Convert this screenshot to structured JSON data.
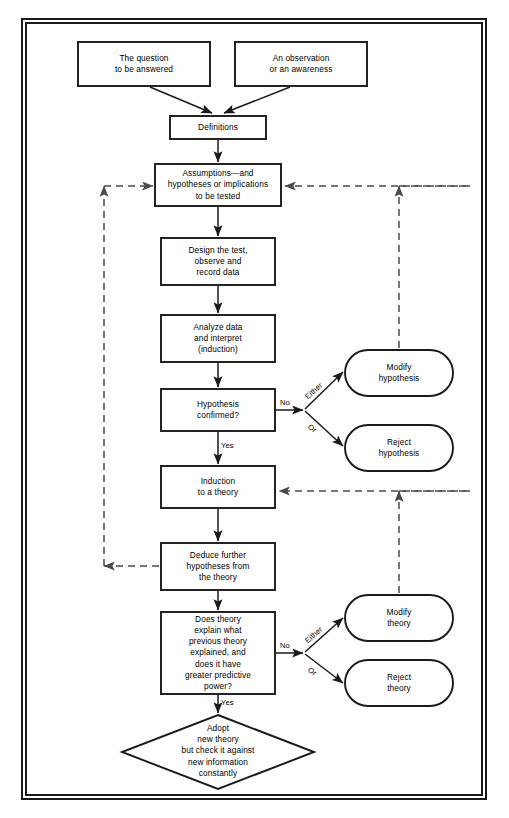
{
  "figure": {
    "type": "flowchart",
    "frame": "double-rule rectangular border"
  },
  "nodes": {
    "question": {
      "label": "The question\nto be answered",
      "shape": "rect"
    },
    "observation": {
      "label": "An observation\nor an awareness",
      "shape": "rect"
    },
    "definitions": {
      "label": "Definitions",
      "shape": "rect"
    },
    "assumptions": {
      "label": "Assumptions—and\nhypotheses or implications\nto be tested",
      "shape": "rect"
    },
    "design_test": {
      "label": "Design the test,\nobserve and\nrecord data",
      "shape": "rect"
    },
    "analyze": {
      "label": "Analyze data\nand interpret\n(induction)",
      "shape": "rect"
    },
    "hyp_confirmed": {
      "label": "Hypothesis\nconfirmed?",
      "shape": "rect"
    },
    "modify_hyp": {
      "label": "Modify\nhypothesis",
      "shape": "rounded"
    },
    "reject_hyp": {
      "label": "Reject\nhypothesis",
      "shape": "rounded"
    },
    "induction": {
      "label": "Induction\nto a theory",
      "shape": "rect"
    },
    "deduce": {
      "label": "Deduce further\nhypotheses from\nthe theory",
      "shape": "rect"
    },
    "does_theory": {
      "label": "Does theory\nexplain what\nprevious theory\nexplained, and\ndoes it have\ngreater predictive\npower?",
      "shape": "rect"
    },
    "modify_theory": {
      "label": "Modify\ntheory",
      "shape": "rounded"
    },
    "reject_theory": {
      "label": "Reject\ntheory",
      "shape": "rounded"
    },
    "adopt": {
      "label": "Adopt\nnew theory\nbut check it against\nnew  information\nconstantly",
      "shape": "diamond"
    }
  },
  "edge_labels": {
    "no_hyp": "No",
    "either_hyp": "Either",
    "or_hyp": "Or",
    "yes_hyp": "Yes",
    "no_theory": "No",
    "either_theory": "Either",
    "or_theory": "Or",
    "yes_theory": "Yes"
  },
  "colors": {
    "line": "#1a1a1a",
    "text": "#000000",
    "background": "#ffffff"
  }
}
